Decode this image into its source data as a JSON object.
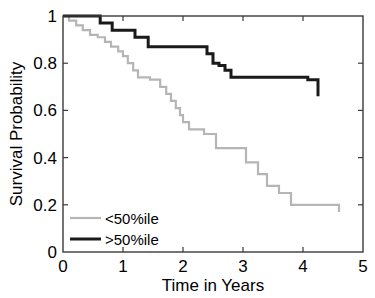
{
  "chart_data": {
    "type": "line",
    "title": "",
    "subtitle": "",
    "xlabel": "Time in Years",
    "ylabel": "Survival Probability",
    "xlim": [
      0,
      5
    ],
    "ylim": [
      0,
      1
    ],
    "xticks": [
      "0",
      "1",
      "2",
      "3",
      "4",
      "5"
    ],
    "xtick_values": [
      0,
      1,
      2,
      3,
      4,
      5
    ],
    "yticks": [
      "0",
      "0.2",
      "0.4",
      "0.6",
      "0.8",
      "1"
    ],
    "ytick_values": [
      0,
      0.2,
      0.4,
      0.6,
      0.8,
      1
    ],
    "grid": false,
    "legend_position": "bottom-left",
    "step_style": "post",
    "series": [
      {
        "name": "<50%ile",
        "color": "#b5b5b5",
        "line_width": 2.2,
        "x": [
          0.0,
          0.1,
          0.22,
          0.33,
          0.45,
          0.58,
          0.7,
          0.8,
          0.92,
          1.0,
          1.08,
          1.17,
          1.25,
          1.45,
          1.62,
          1.72,
          1.8,
          1.88,
          1.95,
          2.0,
          2.1,
          2.35,
          2.55,
          2.8,
          3.05,
          3.25,
          3.4,
          3.6,
          3.8,
          4.6
        ],
        "y": [
          1.0,
          0.98,
          0.96,
          0.94,
          0.92,
          0.91,
          0.89,
          0.87,
          0.85,
          0.83,
          0.8,
          0.77,
          0.74,
          0.73,
          0.7,
          0.67,
          0.64,
          0.61,
          0.58,
          0.55,
          0.52,
          0.5,
          0.44,
          0.44,
          0.38,
          0.33,
          0.28,
          0.25,
          0.2,
          0.17
        ]
      },
      {
        "name": ">50%ile",
        "color": "#1a1a1a",
        "line_width": 3.0,
        "x": [
          0.0,
          0.42,
          0.62,
          0.72,
          0.82,
          1.0,
          1.2,
          1.42,
          2.3,
          2.4,
          2.5,
          2.6,
          2.7,
          2.8,
          4.08,
          4.25
        ],
        "y": [
          1.0,
          1.0,
          0.97,
          0.97,
          0.94,
          0.94,
          0.91,
          0.87,
          0.87,
          0.84,
          0.8,
          0.79,
          0.77,
          0.74,
          0.73,
          0.66
        ]
      }
    ]
  },
  "legend": {
    "items": [
      {
        "label": "<50%ile",
        "color": "#b5b5b5"
      },
      {
        "label": ">50%ile",
        "color": "#1a1a1a"
      }
    ]
  },
  "axes": {
    "x_title": "Time in Years",
    "y_title": "Survival Probability",
    "x_labels": [
      "0",
      "1",
      "2",
      "3",
      "4",
      "5"
    ],
    "y_labels": [
      "0",
      "0.2",
      "0.4",
      "0.6",
      "0.8",
      "1"
    ]
  },
  "style": {
    "axis_color": "#3a3a3a",
    "background": "#ffffff",
    "text_color": "#000000"
  }
}
